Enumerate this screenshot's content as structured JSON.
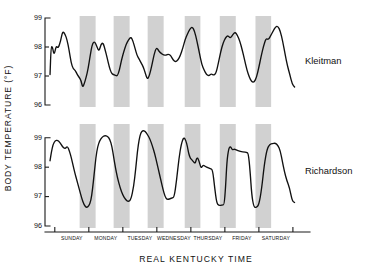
{
  "chart_data": {
    "type": "line",
    "title": "",
    "xlabel": "REAL  KENTUCKY  TIME",
    "ylabel": "BODY  TEMPERATURE  (°F)",
    "grid": false,
    "legend_position": "right-inline",
    "x_tick_labels": [
      "SUNDAY",
      "MONDAY",
      "TUESDAY",
      "WEDNESDAY",
      "THURSDAY",
      "FRIDAY",
      "SATURDAY"
    ],
    "x_unit": "days",
    "xlim": [
      0,
      7.35
    ],
    "panels": [
      {
        "name": "Kleitman",
        "label": "Kleitman",
        "ylim": [
          96,
          99
        ],
        "y_tick_labels": [
          "99",
          "98",
          "97",
          "96"
        ],
        "y_ticks": [
          99,
          98,
          97,
          96
        ],
        "series": [
          {
            "name": "Kleitman body temperature",
            "x": [
              0.06,
              0.09,
              0.13,
              0.18,
              0.24,
              0.3,
              0.37,
              0.43,
              0.5,
              0.56,
              0.62,
              0.68,
              0.74,
              0.8,
              0.86,
              0.92,
              0.97,
              1.02,
              1.07,
              1.12,
              1.18,
              1.24,
              1.3,
              1.37,
              1.44,
              1.5,
              1.56,
              1.62,
              1.68,
              1.74,
              1.8,
              1.86,
              1.92,
              1.98,
              2.04,
              2.1,
              2.16,
              2.23,
              2.3,
              2.37,
              2.44,
              2.5,
              2.56,
              2.62,
              2.68,
              2.74,
              2.8,
              2.86,
              2.92,
              2.98,
              3.05,
              3.12,
              3.19,
              3.26,
              3.33,
              3.4,
              3.47,
              3.54,
              3.61,
              3.68,
              3.75,
              3.82,
              3.89,
              3.96,
              4.03,
              4.1,
              4.17,
              4.24,
              4.31,
              4.38,
              4.45,
              4.52,
              4.59,
              4.66,
              4.73,
              4.8,
              4.87,
              4.94,
              5.01,
              5.08,
              5.15,
              5.22,
              5.29,
              5.36,
              5.43,
              5.5,
              5.57,
              5.64,
              5.71,
              5.78,
              5.85,
              5.92,
              5.99,
              6.06,
              6.13,
              6.2,
              6.27,
              6.34,
              6.41,
              6.48,
              6.55,
              6.62,
              6.69,
              6.76,
              6.83,
              6.9,
              6.97,
              7.04,
              7.11,
              7.18,
              7.25
            ],
            "y": [
              97.05,
              98.0,
              98.02,
              97.7,
              98.05,
              97.95,
              98.2,
              98.55,
              98.45,
              98.25,
              97.9,
              97.45,
              97.25,
              97.2,
              97.05,
              96.95,
              96.85,
              96.6,
              96.75,
              96.95,
              97.25,
              97.7,
              98.1,
              98.2,
              98.0,
              97.85,
              98.1,
              98.15,
              97.9,
              97.62,
              97.32,
              97.1,
              97.05,
              97.02,
              97.0,
              97.2,
              97.55,
              97.85,
              98.1,
              98.25,
              98.35,
              98.2,
              97.95,
              97.7,
              97.58,
              97.45,
              97.32,
              97.1,
              96.88,
              97.0,
              97.35,
              97.75,
              98.0,
              97.85,
              97.78,
              97.72,
              97.72,
              97.76,
              97.7,
              97.55,
              97.48,
              97.55,
              97.7,
              97.95,
              98.25,
              98.45,
              98.62,
              98.7,
              98.55,
              98.2,
              97.8,
              97.4,
              97.2,
              97.05,
              97.0,
              97.08,
              97.02,
              97.1,
              97.45,
              97.85,
              98.15,
              98.32,
              98.4,
              98.3,
              98.42,
              98.52,
              98.4,
              98.2,
              97.9,
              97.55,
              97.2,
              96.95,
              96.8,
              96.78,
              96.95,
              97.3,
              97.7,
              98.05,
              98.3,
              98.25,
              98.4,
              98.55,
              98.7,
              98.72,
              98.55,
              98.2,
              97.75,
              97.35,
              97.05,
              96.72,
              96.62,
              96.85,
              97.1
            ]
          }
        ]
      },
      {
        "name": "Richardson",
        "label": "Richardson",
        "ylim": [
          96,
          99.4
        ],
        "y_tick_labels": [
          "99",
          "98",
          "97",
          "96"
        ],
        "y_ticks": [
          99,
          98,
          97,
          96
        ],
        "series": [
          {
            "name": "Richardson body temperature",
            "x": [
              0.06,
              0.1,
              0.15,
              0.21,
              0.28,
              0.35,
              0.42,
              0.5,
              0.57,
              0.63,
              0.69,
              0.74,
              0.79,
              0.85,
              0.92,
              0.99,
              1.06,
              1.13,
              1.2,
              1.26,
              1.31,
              1.36,
              1.41,
              1.46,
              1.52,
              1.59,
              1.67,
              1.75,
              1.82,
              1.88,
              1.93,
              1.98,
              2.04,
              2.12,
              2.2,
              2.28,
              2.36,
              2.44,
              2.52,
              2.58,
              2.63,
              2.68,
              2.73,
              2.79,
              2.86,
              2.93,
              3.0,
              3.07,
              3.14,
              3.2,
              3.26,
              3.32,
              3.38,
              3.44,
              3.5,
              3.57,
              3.64,
              3.71,
              3.78,
              3.85,
              3.92,
              3.99,
              4.05,
              4.1,
              4.13,
              4.16,
              4.19,
              4.23,
              4.28,
              4.33,
              4.38,
              4.44,
              4.5,
              4.56,
              4.63,
              4.7,
              4.77,
              4.84,
              4.9,
              4.96,
              5.02,
              5.08,
              5.13,
              5.18,
              5.22,
              5.26,
              5.31,
              5.36,
              5.42,
              5.48,
              5.55,
              5.62,
              5.69,
              5.76,
              5.83,
              5.89,
              5.94,
              5.99,
              6.05,
              6.12,
              6.2,
              6.28,
              6.36,
              6.44,
              6.52,
              6.6,
              6.68,
              6.76,
              6.83,
              6.89,
              6.95,
              7.02,
              7.1,
              7.18,
              7.25
            ],
            "y": [
              98.22,
              98.52,
              98.78,
              98.9,
              98.92,
              98.85,
              98.7,
              98.62,
              98.72,
              98.55,
              98.3,
              98.05,
              97.8,
              97.55,
              97.25,
              96.95,
              96.72,
              96.62,
              96.68,
              96.85,
              97.25,
              97.8,
              98.35,
              98.7,
              98.9,
              99.02,
              99.08,
              99.05,
              98.95,
              98.7,
              98.35,
              98.0,
              97.65,
              97.3,
              97.05,
              96.9,
              96.82,
              96.9,
              97.35,
              97.95,
              98.55,
              98.95,
              99.18,
              99.25,
              99.22,
              99.1,
              98.95,
              98.72,
              98.45,
              98.15,
              97.85,
              97.55,
              97.25,
              97.0,
              96.9,
              96.92,
              96.95,
              96.98,
              97.55,
              98.3,
              98.8,
              99.02,
              98.92,
              98.7,
              98.5,
              98.38,
              98.3,
              98.25,
              98.18,
              98.12,
              98.35,
              98.22,
              97.95,
              98.08,
              98.02,
              97.98,
              97.95,
              97.92,
              97.3,
              96.78,
              96.7,
              96.7,
              96.72,
              96.72,
              97.3,
              98.2,
              98.62,
              98.72,
              98.58,
              98.62,
              98.58,
              98.55,
              98.52,
              98.52,
              98.5,
              98.48,
              97.9,
              97.05,
              96.65,
              96.62,
              96.72,
              97.25,
              98.1,
              98.62,
              98.78,
              98.8,
              98.82,
              98.75,
              98.55,
              98.2,
              97.85,
              97.55,
              97.3,
              96.85,
              96.8,
              96.78
            ]
          }
        ]
      }
    ],
    "night_bands": [
      {
        "start": 0.93,
        "end": 1.4
      },
      {
        "start": 1.93,
        "end": 2.4
      },
      {
        "start": 2.93,
        "end": 3.4
      },
      {
        "start": 4.02,
        "end": 4.48
      },
      {
        "start": 5.05,
        "end": 5.52
      },
      {
        "start": 6.1,
        "end": 6.56
      }
    ],
    "night_band_color": "#c9c9c9",
    "trace_color": "#111111",
    "axis_color": "#1a1a1a"
  },
  "figure": {
    "axis_title_x": "REAL  KENTUCKY  TIME",
    "axis_title_y": "BODY  TEMPERATURE  (°F)",
    "panel_top_label": "Kleitman",
    "panel_bottom_label": "Richardson",
    "ytick_99": "99",
    "ytick_98": "98",
    "ytick_97": "97",
    "ytick_96": "96",
    "ytick_b99": "99",
    "ytick_b98": "98",
    "ytick_b97": "97",
    "ytick_b96": "96",
    "xtick_sunday": "SUNDAY",
    "xtick_monday": "MONDAY",
    "xtick_tuesday": "TUESDAY",
    "xtick_wednesday": "WEDNESDAY",
    "xtick_thursday": "THURSDAY",
    "xtick_friday": "FRIDAY",
    "xtick_saturday": "SATURDAY"
  }
}
